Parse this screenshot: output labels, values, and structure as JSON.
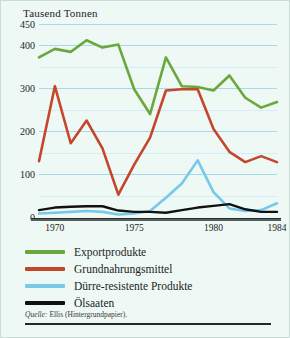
{
  "figure": {
    "title": "Tausend Tonnen",
    "source_lead": "Quelle:",
    "source_text": "Ellis (Hintergrundpapier)."
  },
  "legend": {
    "items": [
      {
        "label": "Exportprodukte",
        "color": "#6aa83c",
        "name": "exportprodukte"
      },
      {
        "label": "Grundnahrungsmittel",
        "color": "#c4472b",
        "name": "grundnahrungsmittel"
      },
      {
        "label": "Dürre-resistente Produkte",
        "color": "#79c8e8",
        "name": "duerre-resistente-produkte"
      },
      {
        "label": "Ölsaaten",
        "color": "#111111",
        "name": "oelsaaten"
      }
    ]
  },
  "chart_data": {
    "type": "line",
    "title": "Tausend Tonnen",
    "xlabel": "",
    "ylabel": "Tausend Tonnen",
    "ylim": [
      0,
      450
    ],
    "xlim": [
      1969,
      1984
    ],
    "grid": true,
    "legend_position": "below",
    "y_ticks": [
      0,
      100,
      200,
      300,
      400,
      450
    ],
    "y_gridlines": [
      50,
      100,
      150,
      200,
      250,
      300,
      350,
      400,
      450
    ],
    "x_tick_labels": [
      "1970",
      "1975",
      "1980",
      "1984"
    ],
    "x_tick_values": [
      1970,
      1975,
      1980,
      1984
    ],
    "x": [
      1969,
      1970,
      1971,
      1972,
      1973,
      1974,
      1975,
      1976,
      1977,
      1978,
      1979,
      1980,
      1981,
      1982,
      1983,
      1984
    ],
    "series": [
      {
        "name": "Exportprodukte",
        "color": "#6aa83c",
        "values": [
          372,
          392,
          385,
          412,
          395,
          402,
          298,
          240,
          372,
          305,
          303,
          295,
          330,
          278,
          255,
          268
        ]
      },
      {
        "name": "Grundnahrungsmittel",
        "color": "#c4472b",
        "values": [
          130,
          305,
          172,
          225,
          160,
          52,
          122,
          185,
          295,
          298,
          298,
          205,
          152,
          128,
          142,
          128
        ]
      },
      {
        "name": "Dürre-resistente Produkte",
        "color": "#79c8e8",
        "values": [
          8,
          10,
          12,
          14,
          12,
          6,
          8,
          14,
          45,
          78,
          132,
          58,
          20,
          14,
          16,
          32
        ]
      },
      {
        "name": "Ölsaaten",
        "color": "#111111",
        "values": [
          16,
          22,
          24,
          25,
          25,
          15,
          12,
          12,
          10,
          16,
          22,
          26,
          30,
          18,
          12,
          12
        ]
      }
    ]
  }
}
